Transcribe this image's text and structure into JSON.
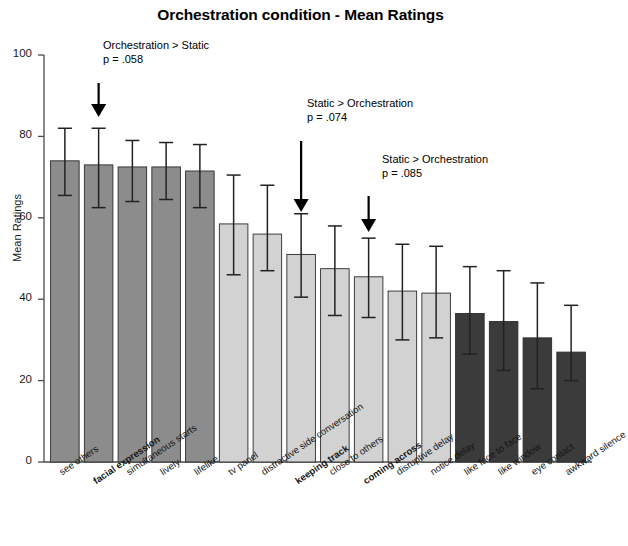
{
  "chart_data": {
    "type": "bar",
    "title": "Orchestration condition - Mean Ratings",
    "xlabel": "",
    "ylabel": "Mean Ratings",
    "ylim": [
      0,
      100
    ],
    "yticks": [
      0,
      20,
      40,
      60,
      80,
      100
    ],
    "grid": false,
    "legend": "none",
    "categories": [
      "see others",
      "facial expression",
      "simultaneous starts",
      "lively",
      "lifelike",
      "tv panel",
      "distractive side conversation",
      "keeping track",
      "close to others",
      "coming across",
      "disruptive delay",
      "notice delay",
      "like face to face",
      "like window",
      "eye contact",
      "awkward silence"
    ],
    "category_bold": [
      false,
      true,
      false,
      false,
      false,
      false,
      false,
      true,
      false,
      true,
      false,
      false,
      false,
      false,
      false,
      false
    ],
    "values": [
      74,
      73,
      72.5,
      72.5,
      71.5,
      58.5,
      56,
      51,
      47.5,
      45.5,
      42,
      41.5,
      36.5,
      34.5,
      30.5,
      27
    ],
    "errors_upper": [
      82,
      82,
      79,
      78.5,
      78,
      70.5,
      68,
      61,
      58,
      55,
      53.5,
      53,
      48,
      47,
      44,
      38.5
    ],
    "errors_lower": [
      65.5,
      62.5,
      64,
      64.5,
      62.5,
      46,
      47,
      40.5,
      36,
      35.5,
      30,
      30.5,
      26.5,
      22.5,
      18,
      20
    ],
    "bar_colors": [
      "#8c8c8c",
      "#8c8c8c",
      "#8c8c8c",
      "#8c8c8c",
      "#8c8c8c",
      "#d2d2d2",
      "#d2d2d2",
      "#d2d2d2",
      "#d2d2d2",
      "#d2d2d2",
      "#d2d2d2",
      "#d2d2d2",
      "#3b3b3b",
      "#3b3b3b",
      "#3b3b3b",
      "#3b3b3b"
    ],
    "annotations": [
      {
        "line1": "Orchestration > Static",
        "line2": "p = .058",
        "target_category": "facial expression",
        "target_index": 1
      },
      {
        "line1": "Static > Orchestration",
        "line2": "p = .074",
        "target_category": "keeping track",
        "target_index": 7
      },
      {
        "line1": "Static > Orchestration",
        "line2": "p = .085",
        "target_category": "coming across",
        "target_index": 9
      }
    ]
  },
  "axis": {
    "y_label": "Mean Ratings",
    "y_tick_labels": [
      "100",
      "80",
      "60",
      "40",
      "20",
      "0"
    ]
  },
  "colors": {
    "group_a": "#8c8c8c",
    "group_b": "#d2d2d2",
    "group_c": "#3b3b3b",
    "axis": "#4a4a4a",
    "text": "#111111"
  }
}
